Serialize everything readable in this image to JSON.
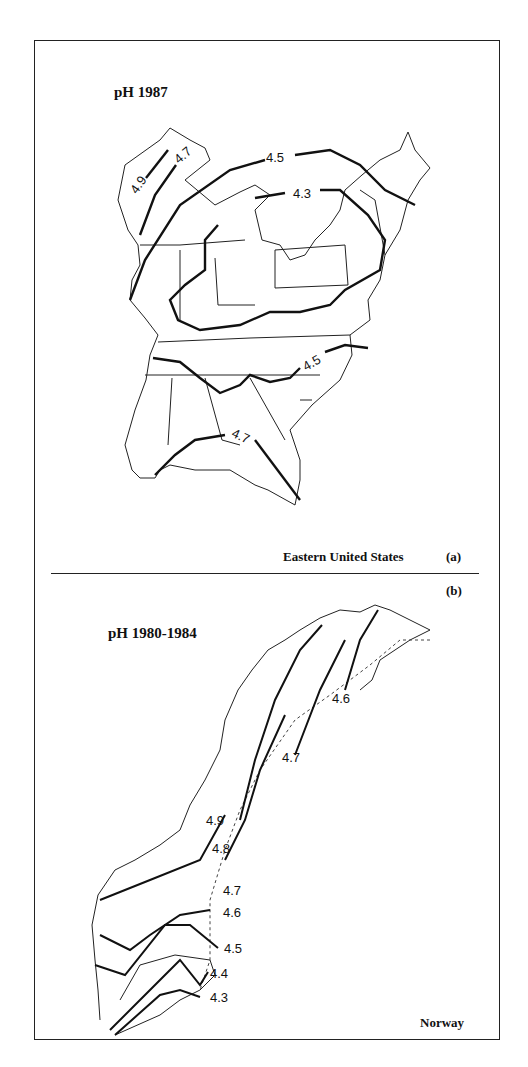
{
  "panel_a": {
    "title": "pH 1987",
    "caption": "Eastern United States",
    "letter": "(a)",
    "contour_labels": [
      "4.9",
      "4.7",
      "4.5",
      "4.3",
      "4.5",
      "4.7"
    ]
  },
  "panel_b": {
    "letter": "(b)",
    "title": "pH 1980-1984",
    "caption": "Norway",
    "contour_labels": [
      "4.6",
      "4.7",
      "4.9",
      "4.8",
      "4.7",
      "4.6",
      "4.5",
      "4.4",
      "4.3"
    ]
  }
}
